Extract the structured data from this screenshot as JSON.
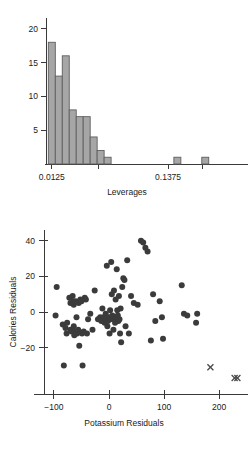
{
  "chart_data": [
    {
      "type": "bar",
      "id": "leverages-histogram",
      "title": "",
      "xlabel": "Leverages",
      "ylabel": "",
      "grid": false,
      "legend": null,
      "xlim": [
        0.00625,
        0.20625
      ],
      "ylim": [
        0,
        21
      ],
      "xtick_values": [
        0.0125,
        0.0625,
        0.1375,
        0.175
      ],
      "xtick_labels": [
        "0.0125",
        "",
        "0.1375",
        ""
      ],
      "ytick_values": [
        5,
        10,
        15,
        20
      ],
      "ytick_labels": [
        "5",
        "10",
        "15",
        "20"
      ],
      "bin_width": 0.0075,
      "bin_starts": [
        0.00875,
        0.01625,
        0.02375,
        0.03125,
        0.03875,
        0.04625,
        0.05375,
        0.06125,
        0.06875,
        0.14375,
        0.17375
      ],
      "categories": [
        "0.00875",
        "0.01625",
        "0.02375",
        "0.03125",
        "0.03875",
        "0.04625",
        "0.05375",
        "0.06125",
        "0.06875",
        "0.14375",
        "0.17375"
      ],
      "values": [
        18,
        13,
        16,
        8,
        7,
        7,
        4,
        2,
        1,
        1,
        1
      ],
      "bar_fill": "#a6a6a6",
      "bar_edge": "#5e5e5e"
    },
    {
      "type": "scatter",
      "id": "residuals-scatter",
      "title": "",
      "xlabel": "Potassium Residuals",
      "ylabel": "Calories Residuals",
      "grid": false,
      "legend": null,
      "xlim": [
        -118,
        245
      ],
      "ylim": [
        -46,
        46
      ],
      "xtick_values": [
        -100,
        0,
        100,
        200
      ],
      "xtick_labels": [
        "−100",
        "0",
        "100",
        "200"
      ],
      "ytick_values": [
        -20,
        0,
        20,
        40
      ],
      "ytick_labels": [
        "−20",
        "0",
        "20",
        "40"
      ],
      "marker_color": "#3b3b3b",
      "marker_size": 3.0,
      "series": [
        {
          "name": "residuals",
          "marker": "circle",
          "points": [
            [
              -95,
              14
            ],
            [
              -97,
              -2
            ],
            [
              -84,
              -7
            ],
            [
              -82,
              -30
            ],
            [
              -79,
              -9
            ],
            [
              -77,
              -12
            ],
            [
              -76,
              -6
            ],
            [
              -72,
              8
            ],
            [
              -70,
              5
            ],
            [
              -70,
              -10
            ],
            [
              -68,
              -11
            ],
            [
              -66,
              9
            ],
            [
              -65,
              6
            ],
            [
              -64,
              4
            ],
            [
              -64,
              -8
            ],
            [
              -63,
              -13
            ],
            [
              -62,
              -11
            ],
            [
              -60,
              6
            ],
            [
              -59,
              -3
            ],
            [
              -58,
              -12
            ],
            [
              -56,
              -10
            ],
            [
              -55,
              5
            ],
            [
              -54,
              -19
            ],
            [
              -52,
              7
            ],
            [
              -50,
              6
            ],
            [
              -49,
              -12
            ],
            [
              -48,
              -30
            ],
            [
              -46,
              -11
            ],
            [
              -44,
              8
            ],
            [
              -42,
              7
            ],
            [
              -40,
              -12
            ],
            [
              -38,
              -4
            ],
            [
              -34,
              -1
            ],
            [
              -30,
              -10
            ],
            [
              -26,
              12
            ],
            [
              -20,
              -4
            ],
            [
              -16,
              -3
            ],
            [
              -14,
              -5
            ],
            [
              -12,
              2
            ],
            [
              -10,
              -3
            ],
            [
              -8,
              -6
            ],
            [
              -6,
              -1
            ],
            [
              -5,
              -4
            ],
            [
              -4,
              26
            ],
            [
              -3,
              -8
            ],
            [
              -2,
              -5
            ],
            [
              0,
              -3
            ],
            [
              1,
              -12
            ],
            [
              2,
              1
            ],
            [
              3,
              -4
            ],
            [
              4,
              28
            ],
            [
              5,
              10
            ],
            [
              6,
              -2
            ],
            [
              8,
              -10
            ],
            [
              9,
              12
            ],
            [
              10,
              -4
            ],
            [
              11,
              -6
            ],
            [
              12,
              7
            ],
            [
              13,
              -3
            ],
            [
              14,
              24
            ],
            [
              15,
              1
            ],
            [
              16,
              -2
            ],
            [
              17,
              -5
            ],
            [
              18,
              9
            ],
            [
              19,
              -4
            ],
            [
              20,
              -12
            ],
            [
              21,
              2
            ],
            [
              22,
              -17
            ],
            [
              24,
              14
            ],
            [
              26,
              19
            ],
            [
              28,
              18
            ],
            [
              30,
              -8
            ],
            [
              33,
              29
            ],
            [
              36,
              -12
            ],
            [
              40,
              9
            ],
            [
              45,
              5
            ],
            [
              52,
              4
            ],
            [
              58,
              40
            ],
            [
              62,
              39
            ],
            [
              66,
              36
            ],
            [
              70,
              34
            ],
            [
              76,
              -16
            ],
            [
              80,
              10
            ],
            [
              84,
              -5
            ],
            [
              92,
              6
            ],
            [
              96,
              -3
            ],
            [
              98,
              -15
            ],
            [
              132,
              15
            ],
            [
              136,
              -1
            ],
            [
              142,
              -2
            ],
            [
              158,
              -6
            ],
            [
              160,
              -1
            ]
          ]
        },
        {
          "name": "outliers",
          "marker": "x",
          "points": [
            [
              184,
              -31
            ],
            [
              228,
              -37
            ],
            [
              233,
              -37
            ]
          ]
        }
      ]
    }
  ]
}
